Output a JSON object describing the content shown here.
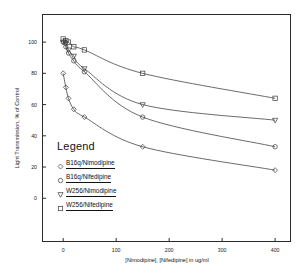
{
  "chart_data": {
    "type": "line",
    "title": "",
    "xlabel": "[Nimodipine], [Nifedipine] in ug/ml",
    "ylabel": "Light Transmission, % of Control",
    "xlim": [
      -40,
      430
    ],
    "ylim": [
      -28,
      118
    ],
    "grid": false,
    "legend_position": "inside-lower-left",
    "legend_title": "Legend",
    "xticks": [
      0,
      100,
      200,
      300,
      400
    ],
    "xtick_labels": [
      "0",
      "100",
      "200",
      "300",
      "400"
    ],
    "yticks": [
      0,
      20,
      40,
      60,
      80,
      100
    ],
    "ytick_labels": [
      "0",
      "20",
      "40",
      "60",
      "80",
      "100"
    ],
    "x": [
      0,
      5,
      10,
      20,
      40,
      150,
      400
    ],
    "series": [
      {
        "name": "B16q/Nimodipine",
        "marker": "diamond",
        "values": [
          80,
          71,
          64,
          57,
          52,
          33,
          18
        ]
      },
      {
        "name": "B16q/Nifedipine",
        "marker": "circle",
        "values": [
          100,
          97,
          93,
          88,
          81,
          52,
          33
        ]
      },
      {
        "name": "W256/Nimodipine",
        "marker": "triangle-down",
        "values": [
          100,
          99,
          95,
          91,
          83,
          60,
          50
        ]
      },
      {
        "name": "W256/Nifedipine",
        "marker": "square",
        "values": [
          102,
          101,
          100,
          97,
          95,
          80,
          64
        ]
      }
    ]
  },
  "legend": {
    "title": "Legend",
    "items": [
      {
        "label": "B16q/Nimodipine",
        "marker": "diamond"
      },
      {
        "label": "B16q/Nifedipine",
        "marker": "circle"
      },
      {
        "label": "W256/Nimodipine",
        "marker": "triangle-down"
      },
      {
        "label": "W256/Nifedipine",
        "marker": "square"
      }
    ]
  },
  "axes": {
    "x_title": "[Nimodipine], [Nifedipine] in ug/ml",
    "y_title": "Light Transmission, % of Control"
  },
  "colors": {
    "line": "#3a3a3a",
    "frame": "#2b2b2b",
    "text": "#111111",
    "background": "#ffffff"
  }
}
